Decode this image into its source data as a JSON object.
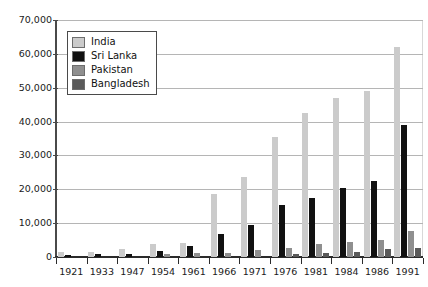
{
  "chart_data": {
    "type": "bar",
    "title": "",
    "subtitle": "",
    "xlabel": "",
    "ylabel": "",
    "grid": true,
    "legend_position": "top-left",
    "categories": [
      "1921",
      "1933",
      "1947",
      "1954",
      "1961",
      "1966",
      "1971",
      "1976",
      "1981",
      "1984",
      "1986",
      "1991"
    ],
    "ylim": [
      0,
      70000
    ],
    "ytick_values": [
      0,
      10000,
      20000,
      30000,
      40000,
      50000,
      60000,
      70000
    ],
    "ytick_labels": [
      "0",
      "10,000",
      "20,000",
      "30,000",
      "40,000",
      "50,000",
      "60,000",
      "70,000"
    ],
    "series": [
      {
        "name": "India",
        "color": "#cbcbcb",
        "values": [
          1400,
          1500,
          2300,
          3700,
          4000,
          18500,
          23500,
          35500,
          42500,
          47000,
          49000,
          62000
        ]
      },
      {
        "name": "Sri Lanka",
        "color": "#111111",
        "values": [
          700,
          900,
          1000,
          1800,
          3200,
          6800,
          9600,
          15300,
          17400,
          20500,
          22400,
          39000
        ]
      },
      {
        "name": "Pakistan",
        "color": "#8f8f8f",
        "values": [
          0,
          0,
          0,
          800,
          1100,
          1300,
          2000,
          2700,
          3800,
          4300,
          5000,
          7800
        ]
      },
      {
        "name": "Bangladesh",
        "color": "#5a5a5a",
        "values": [
          0,
          0,
          0,
          0,
          0,
          0,
          0,
          900,
          1100,
          1400,
          2300,
          2600
        ]
      }
    ]
  },
  "legend": {
    "items": [
      {
        "label": "India",
        "color": "#cbcbcb"
      },
      {
        "label": "Sri Lanka",
        "color": "#111111"
      },
      {
        "label": "Pakistan",
        "color": "#8f8f8f"
      },
      {
        "label": "Bangladesh",
        "color": "#5a5a5a"
      }
    ]
  }
}
